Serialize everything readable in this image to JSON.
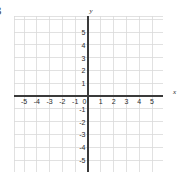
{
  "figure": {
    "label": "3",
    "background_color": "#ffffff",
    "width": 180,
    "height": 184
  },
  "chart_data": {
    "type": "scatter",
    "title": "",
    "subtitle": "",
    "xlabel": "x",
    "ylabel": "y",
    "xlim": [
      -5.8,
      6.2
    ],
    "ylim": [
      -5.9,
      6.1
    ],
    "x_tick_labels": [
      "-5",
      "-4",
      "-3",
      "-2",
      "-1",
      "0",
      "1",
      "2",
      "3",
      "4",
      "5"
    ],
    "y_tick_labels": [
      "5",
      "4",
      "3",
      "2",
      "1",
      "-1",
      "-2",
      "-3",
      "-4",
      "-5"
    ],
    "x_ticks": [
      -5,
      -4,
      -3,
      -2,
      -1,
      0,
      1,
      2,
      3,
      4,
      5
    ],
    "y_ticks": [
      5,
      4,
      3,
      2,
      1,
      -1,
      -2,
      -3,
      -4,
      -5
    ],
    "origin_label": "0",
    "grid": true,
    "grid_step": 1,
    "grid_color": "#d9d9d9",
    "axis_color": "#3a3a3a",
    "legend": [],
    "series": [],
    "values": [],
    "categories": [],
    "annotations": []
  },
  "axes": {
    "x_axis_name": "x",
    "y_axis_name": "y"
  }
}
